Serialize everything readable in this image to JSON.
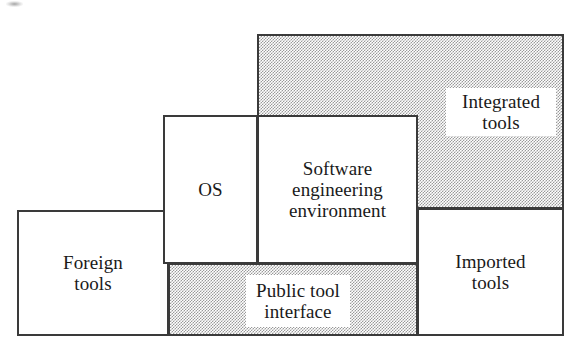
{
  "diagram": {
    "colors": {
      "stroke": "#3a3a3a",
      "shading": "#9a9a9a",
      "background": "#ffffff",
      "text": "#1a1a1a"
    },
    "blocks": [
      {
        "id": "foreign-tools",
        "label": "Foreign\ntools",
        "line1": "Foreign",
        "line2": "tools",
        "style": "outline"
      },
      {
        "id": "os",
        "label": "OS",
        "line1": "OS",
        "line2": "",
        "style": "outline"
      },
      {
        "id": "software-engineering-environment",
        "label": "Software\nengineering\nenvironment",
        "line1": "Software",
        "line2": "engineering",
        "line3": "environment",
        "style": "outline"
      },
      {
        "id": "integrated-tools",
        "label": "Integrated\ntools",
        "line1": "Integrated",
        "line2": "tools",
        "style": "shaded"
      },
      {
        "id": "imported-tools",
        "label": "Imported\ntools",
        "line1": "Imported",
        "line2": "tools",
        "style": "outline"
      },
      {
        "id": "public-tool-interface",
        "label": "Public tool\ninterface",
        "line1": "Public tool",
        "line2": "interface",
        "style": "shaded"
      }
    ]
  }
}
